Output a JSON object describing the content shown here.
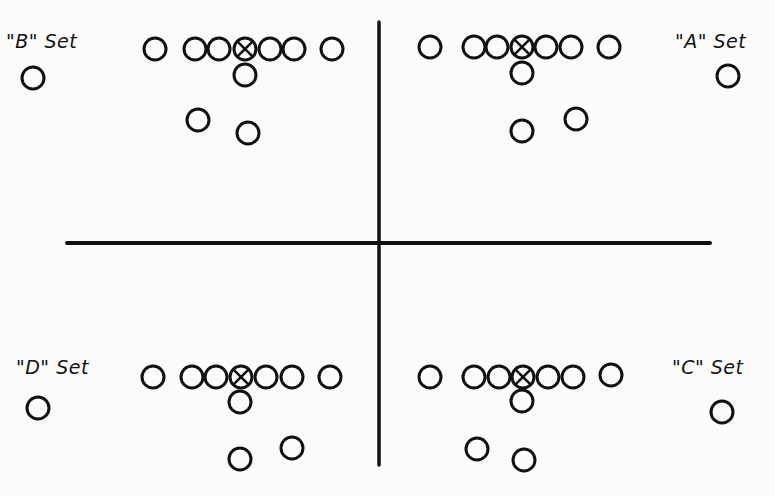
{
  "diagram": {
    "type": "football-formation-sets",
    "colors": {
      "ink": "#111111",
      "background": "#fbfbf9"
    },
    "axes": {
      "vertical": {
        "x": 379,
        "y1": 22,
        "y2": 465
      },
      "horizontal": {
        "y": 243,
        "x1": 67,
        "x2": 710
      }
    },
    "player_radius": 11,
    "sets": [
      {
        "id": "B",
        "label": "\"B\" Set",
        "label_pos": {
          "x": 6,
          "y": 30
        },
        "line": [
          {
            "x": 155,
            "y": 49
          },
          {
            "x": 195,
            "y": 49
          },
          {
            "x": 219,
            "y": 49
          },
          {
            "x": 245,
            "y": 49,
            "center": true
          },
          {
            "x": 270,
            "y": 49
          },
          {
            "x": 294,
            "y": 49
          },
          {
            "x": 332,
            "y": 49
          }
        ],
        "backs": [
          {
            "x": 245,
            "y": 75
          },
          {
            "x": 198,
            "y": 120
          },
          {
            "x": 248,
            "y": 133
          },
          {
            "x": 33,
            "y": 78
          }
        ]
      },
      {
        "id": "A",
        "label": "\"A\" Set",
        "label_pos": {
          "x": 675,
          "y": 30
        },
        "line": [
          {
            "x": 430,
            "y": 47
          },
          {
            "x": 474,
            "y": 47
          },
          {
            "x": 497,
            "y": 47
          },
          {
            "x": 522,
            "y": 47,
            "center": true
          },
          {
            "x": 546,
            "y": 47
          },
          {
            "x": 571,
            "y": 47
          },
          {
            "x": 609,
            "y": 47
          }
        ],
        "backs": [
          {
            "x": 522,
            "y": 73
          },
          {
            "x": 522,
            "y": 131
          },
          {
            "x": 576,
            "y": 119
          },
          {
            "x": 728,
            "y": 76
          }
        ]
      },
      {
        "id": "D",
        "label": "\"D\" Set",
        "label_pos": {
          "x": 16,
          "y": 356
        },
        "line": [
          {
            "x": 153,
            "y": 377
          },
          {
            "x": 192,
            "y": 377
          },
          {
            "x": 216,
            "y": 377
          },
          {
            "x": 241,
            "y": 377,
            "center": true
          },
          {
            "x": 266,
            "y": 377
          },
          {
            "x": 292,
            "y": 377
          },
          {
            "x": 330,
            "y": 377
          }
        ],
        "backs": [
          {
            "x": 240,
            "y": 402
          },
          {
            "x": 240,
            "y": 459
          },
          {
            "x": 292,
            "y": 448
          },
          {
            "x": 38,
            "y": 408
          }
        ]
      },
      {
        "id": "C",
        "label": "\"C\" Set",
        "label_pos": {
          "x": 672,
          "y": 356
        },
        "line": [
          {
            "x": 430,
            "y": 377
          },
          {
            "x": 474,
            "y": 377
          },
          {
            "x": 499,
            "y": 377
          },
          {
            "x": 523,
            "y": 377,
            "center": true
          },
          {
            "x": 548,
            "y": 377
          },
          {
            "x": 573,
            "y": 377
          },
          {
            "x": 611,
            "y": 375
          }
        ],
        "backs": [
          {
            "x": 522,
            "y": 401
          },
          {
            "x": 477,
            "y": 449
          },
          {
            "x": 524,
            "y": 460
          },
          {
            "x": 722,
            "y": 412
          }
        ]
      }
    ]
  }
}
